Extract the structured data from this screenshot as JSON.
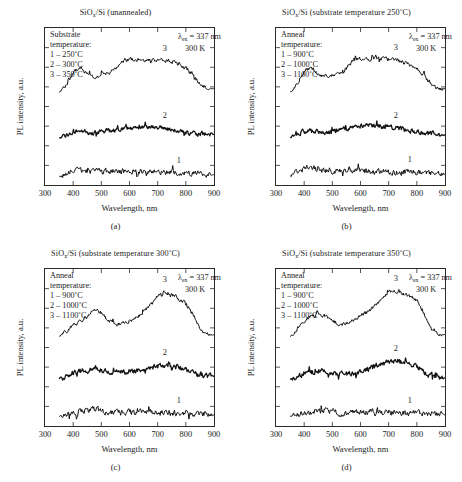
{
  "figure": {
    "width": 462,
    "height": 482,
    "background": "#ffffff",
    "ink_color": "#1a1a1a",
    "caption_cut_off": ""
  },
  "axis_common": {
    "xlabel": "Wavelength, nm",
    "ylabel": "PL intensity, a.u.",
    "xticks": [
      300,
      400,
      500,
      600,
      700,
      800,
      900
    ],
    "xlim": [
      300,
      900
    ],
    "ylim": [
      0,
      1
    ],
    "y_ticklabels_shown": false,
    "grid": false,
    "excitation_label": "= 337 nm",
    "lambda_symbol": "λ",
    "lambda_subscript": "ex",
    "temperature_label": "300 K"
  },
  "panels": [
    {
      "letter": "(a)",
      "title_prefix": "SiO",
      "title_sub": "x",
      "title_suffix": "/Si (unannealed)",
      "legend_heading_line1": "Substrate",
      "legend_heading_line2": "temperature:",
      "legend_items": [
        "1 – 250˚C",
        "2 – 300˚C",
        "3 – 350˚C"
      ],
      "chart_data": {
        "type": "line",
        "title": "SiOx/Si (unannealed)",
        "xlabel": "Wavelength, nm",
        "ylabel": "PL intensity, a.u.",
        "xlim": [
          300,
          900
        ],
        "ylim": [
          0,
          1
        ],
        "grid": false,
        "legend_position": "upper-left",
        "x": [
          350,
          375,
          400,
          425,
          450,
          475,
          500,
          525,
          550,
          575,
          600,
          625,
          650,
          675,
          700,
          725,
          750,
          775,
          800,
          825,
          850,
          875,
          900
        ],
        "series": [
          {
            "name": "1",
            "label": "1 – 250˚C",
            "annotation": "1",
            "noise": 0.028,
            "values": [
              0.055,
              0.075,
              0.092,
              0.098,
              0.09,
              0.086,
              0.088,
              0.09,
              0.089,
              0.088,
              0.086,
              0.085,
              0.084,
              0.083,
              0.082,
              0.08,
              0.078,
              0.076,
              0.074,
              0.072,
              0.07,
              0.068,
              0.066
            ]
          },
          {
            "name": "2",
            "label": "2 – 300˚C",
            "annotation": "2",
            "noise": 0.022,
            "values": [
              0.3,
              0.318,
              0.336,
              0.345,
              0.336,
              0.333,
              0.34,
              0.346,
              0.35,
              0.356,
              0.364,
              0.368,
              0.37,
              0.368,
              0.364,
              0.36,
              0.352,
              0.344,
              0.336,
              0.33,
              0.326,
              0.322,
              0.32
            ]
          },
          {
            "name": "3",
            "label": "3 – 350˚C",
            "annotation": "3",
            "noise": 0.02,
            "values": [
              0.59,
              0.64,
              0.712,
              0.74,
              0.706,
              0.69,
              0.7,
              0.712,
              0.736,
              0.786,
              0.8,
              0.8,
              0.796,
              0.802,
              0.798,
              0.792,
              0.786,
              0.77,
              0.744,
              0.7,
              0.652,
              0.62,
              0.615
            ]
          }
        ]
      }
    },
    {
      "letter": "(b)",
      "title_prefix": "SiO",
      "title_sub": "x",
      "title_suffix": "/Si (substrate temperature 250˚C)",
      "legend_heading_line1": "Anneal",
      "legend_heading_line2": "temperature:",
      "legend_items": [
        "1 – 900˚C",
        "2 – 1000˚C",
        "3 – 1100˚C"
      ],
      "chart_data": {
        "type": "line",
        "title": "SiOx/Si (substrate temperature 250˚C)",
        "xlabel": "Wavelength, nm",
        "ylabel": "PL intensity, a.u.",
        "xlim": [
          300,
          900
        ],
        "ylim": [
          0,
          1
        ],
        "grid": false,
        "legend_position": "upper-left",
        "x": [
          350,
          375,
          400,
          425,
          450,
          475,
          500,
          525,
          550,
          575,
          600,
          625,
          650,
          675,
          700,
          725,
          750,
          775,
          800,
          825,
          850,
          875,
          900
        ],
        "series": [
          {
            "name": "1",
            "label": "1 – 900˚C",
            "annotation": "1",
            "noise": 0.03,
            "values": [
              0.06,
              0.082,
              0.1,
              0.104,
              0.094,
              0.09,
              0.092,
              0.094,
              0.096,
              0.092,
              0.09,
              0.088,
              0.088,
              0.087,
              0.086,
              0.084,
              0.082,
              0.08,
              0.078,
              0.076,
              0.074,
              0.072,
              0.07
            ]
          },
          {
            "name": "2",
            "label": "2 – 1000˚C",
            "annotation": "2",
            "noise": 0.024,
            "values": [
              0.304,
              0.32,
              0.34,
              0.352,
              0.34,
              0.336,
              0.344,
              0.35,
              0.356,
              0.364,
              0.372,
              0.376,
              0.376,
              0.372,
              0.368,
              0.362,
              0.354,
              0.344,
              0.336,
              0.33,
              0.326,
              0.322,
              0.32
            ]
          },
          {
            "name": "3",
            "label": "3 – 1100˚C",
            "annotation": "3",
            "noise": 0.02,
            "values": [
              0.594,
              0.648,
              0.718,
              0.742,
              0.708,
              0.692,
              0.7,
              0.716,
              0.744,
              0.792,
              0.804,
              0.802,
              0.798,
              0.804,
              0.8,
              0.794,
              0.784,
              0.766,
              0.74,
              0.696,
              0.65,
              0.618,
              0.612
            ]
          }
        ]
      }
    },
    {
      "letter": "(c)",
      "title_prefix": "SiO",
      "title_sub": "x",
      "title_suffix": "/Si (substrate temperature 300˚C)",
      "legend_heading_line1": "Anneal",
      "legend_heading_line2": "temperature:",
      "legend_items": [
        "1 – 900˚C",
        "2 – 1000˚C",
        "3 – 1100˚C"
      ],
      "chart_data": {
        "type": "line",
        "title": "SiOx/Si (substrate temperature 300˚C)",
        "xlabel": "Wavelength, nm",
        "ylabel": "PL intensity, a.u.",
        "xlim": [
          300,
          900
        ],
        "ylim": [
          0,
          1
        ],
        "grid": false,
        "legend_position": "upper-left",
        "x": [
          350,
          375,
          400,
          425,
          450,
          475,
          500,
          525,
          550,
          575,
          600,
          625,
          650,
          675,
          700,
          725,
          750,
          775,
          800,
          825,
          850,
          875,
          900
        ],
        "series": [
          {
            "name": "1",
            "label": "1 – 900˚C",
            "annotation": "1",
            "noise": 0.03,
            "values": [
              0.062,
              0.078,
              0.09,
              0.092,
              0.096,
              0.104,
              0.096,
              0.086,
              0.084,
              0.086,
              0.085,
              0.084,
              0.086,
              0.088,
              0.088,
              0.086,
              0.084,
              0.082,
              0.08,
              0.078,
              0.076,
              0.074,
              0.072
            ]
          },
          {
            "name": "2",
            "label": "2 – 1000˚C",
            "annotation": "2",
            "noise": 0.026,
            "values": [
              0.3,
              0.318,
              0.336,
              0.344,
              0.352,
              0.366,
              0.358,
              0.344,
              0.34,
              0.344,
              0.348,
              0.352,
              0.36,
              0.372,
              0.382,
              0.386,
              0.382,
              0.372,
              0.356,
              0.34,
              0.328,
              0.32,
              0.316
            ]
          },
          {
            "name": "3",
            "label": "3 – 1100˚C",
            "annotation": "3",
            "noise": 0.02,
            "values": [
              0.57,
              0.604,
              0.64,
              0.664,
              0.696,
              0.736,
              0.718,
              0.672,
              0.652,
              0.656,
              0.668,
              0.69,
              0.724,
              0.774,
              0.826,
              0.852,
              0.838,
              0.812,
              0.78,
              0.712,
              0.63,
              0.588,
              0.58
            ]
          }
        ]
      }
    },
    {
      "letter": "(d)",
      "title_prefix": "SiO",
      "title_sub": "x",
      "title_suffix": "/Si (substrate temperature 350˚C)",
      "legend_heading_line1": "Anneal",
      "legend_heading_line2": "temperature:",
      "legend_items": [
        "1 – 900˚C",
        "2 – 1000˚C",
        "3 – 1100˚C"
      ],
      "chart_data": {
        "type": "line",
        "title": "SiOx/Si (substrate temperature 350˚C)",
        "xlabel": "Wavelength, nm",
        "ylabel": "PL intensity, a.u.",
        "xlim": [
          300,
          900
        ],
        "ylim": [
          0,
          1
        ],
        "grid": false,
        "legend_position": "upper-left",
        "x": [
          350,
          375,
          400,
          425,
          450,
          475,
          500,
          525,
          550,
          575,
          600,
          625,
          650,
          675,
          700,
          725,
          750,
          775,
          800,
          825,
          850,
          875,
          900
        ],
        "series": [
          {
            "name": "1",
            "label": "1 – 900˚C",
            "annotation": "1",
            "noise": 0.03,
            "values": [
              0.06,
              0.072,
              0.082,
              0.09,
              0.098,
              0.1,
              0.092,
              0.084,
              0.082,
              0.084,
              0.086,
              0.088,
              0.09,
              0.09,
              0.09,
              0.088,
              0.086,
              0.084,
              0.082,
              0.08,
              0.078,
              0.076,
              0.074
            ]
          },
          {
            "name": "2",
            "label": "2 – 1000˚C",
            "annotation": "2",
            "noise": 0.026,
            "values": [
              0.296,
              0.312,
              0.33,
              0.344,
              0.352,
              0.35,
              0.338,
              0.33,
              0.332,
              0.34,
              0.35,
              0.362,
              0.376,
              0.392,
              0.406,
              0.414,
              0.412,
              0.4,
              0.376,
              0.344,
              0.322,
              0.312,
              0.308
            ]
          },
          {
            "name": "3",
            "label": "3 – 1100˚C",
            "annotation": "3",
            "noise": 0.02,
            "values": [
              0.568,
              0.616,
              0.668,
              0.7,
              0.712,
              0.702,
              0.672,
              0.648,
              0.656,
              0.676,
              0.7,
              0.728,
              0.764,
              0.812,
              0.848,
              0.862,
              0.846,
              0.828,
              0.796,
              0.72,
              0.63,
              0.586,
              0.582
            ]
          }
        ]
      }
    }
  ]
}
